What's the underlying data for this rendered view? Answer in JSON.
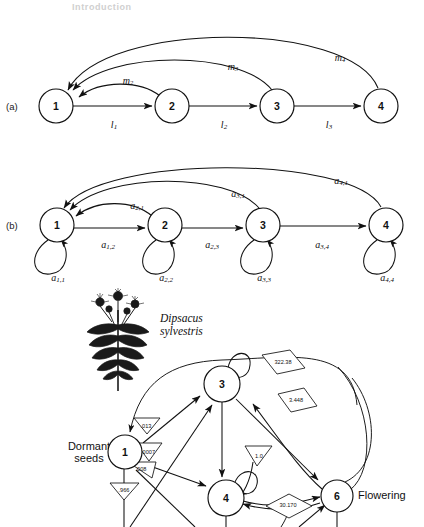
{
  "header": {
    "running_title": "Introduction"
  },
  "panel_a": {
    "tag": "(a)",
    "nodes": [
      {
        "id": "1",
        "cx": 56,
        "cy": 106
      },
      {
        "id": "2",
        "cx": 172,
        "cy": 106
      },
      {
        "id": "3",
        "cx": 277,
        "cy": 106
      },
      {
        "id": "4",
        "cx": 381,
        "cy": 106
      }
    ],
    "forward_labels": [
      {
        "base": "l",
        "sub": "1",
        "x": 114,
        "y": 124
      },
      {
        "base": "l",
        "sub": "2",
        "x": 224,
        "y": 124
      },
      {
        "base": "l",
        "sub": "3",
        "x": 329,
        "y": 124
      }
    ],
    "return_labels": [
      {
        "base": "m",
        "sub": "2",
        "x": 128,
        "y": 80
      },
      {
        "base": "m",
        "sub": "3",
        "x": 233,
        "y": 66
      },
      {
        "base": "m",
        "sub": "4",
        "x": 340,
        "y": 57
      }
    ]
  },
  "panel_b": {
    "tag": "(b)",
    "nodes": [
      {
        "id": "1",
        "cx": 57,
        "cy": 225
      },
      {
        "id": "2",
        "cx": 165,
        "cy": 225
      },
      {
        "id": "3",
        "cx": 263,
        "cy": 225
      },
      {
        "id": "4",
        "cx": 386,
        "cy": 225
      }
    ],
    "forward_labels": [
      {
        "base": "a",
        "sub": "1,2",
        "x": 108,
        "y": 244
      },
      {
        "base": "a",
        "sub": "2,3",
        "x": 212,
        "y": 244
      },
      {
        "base": "a",
        "sub": "3,4",
        "x": 322,
        "y": 244
      }
    ],
    "return_labels": [
      {
        "base": "a",
        "sub": "2,1",
        "x": 137,
        "y": 205
      },
      {
        "base": "a",
        "sub": "3,1",
        "x": 238,
        "y": 193
      },
      {
        "base": "a",
        "sub": "4,1",
        "x": 341,
        "y": 180
      }
    ],
    "self_labels": [
      {
        "base": "a",
        "sub": "1,1",
        "x": 58,
        "y": 277
      },
      {
        "base": "a",
        "sub": "2,2",
        "x": 166,
        "y": 277
      },
      {
        "base": "a",
        "sub": "3,3",
        "x": 264,
        "y": 277
      },
      {
        "base": "a",
        "sub": "4,4",
        "x": 387,
        "y": 277
      }
    ]
  },
  "life_cycle": {
    "species": "Dipsacus\nsylvestris",
    "species_line1": "Dipsacus",
    "species_line2": "sylvestris",
    "dormant_label_line1": "Dormant",
    "dormant_label_line2": "seeds",
    "flowering_label": "Flowering",
    "nodes": [
      {
        "id": "1",
        "cx": 125,
        "cy": 452,
        "r": 17
      },
      {
        "id": "3",
        "cx": 222,
        "cy": 384,
        "r": 18
      },
      {
        "id": "4",
        "cx": 226,
        "cy": 498,
        "r": 18
      },
      {
        "id": "6",
        "cx": 337,
        "cy": 496,
        "r": 16
      }
    ],
    "triangle_values": [
      {
        "value": ".013",
        "x": 146,
        "y": 426
      },
      {
        "value": ".0007",
        "x": 148,
        "y": 452
      },
      {
        "value": ".008",
        "x": 141,
        "y": 469
      },
      {
        "value": ".966",
        "x": 124,
        "y": 490
      },
      {
        "value": "1.0",
        "x": 259,
        "y": 456
      }
    ],
    "diamond_values": [
      {
        "value": "322.38",
        "x": 283,
        "y": 362
      },
      {
        "value": "3.448",
        "x": 296,
        "y": 400
      },
      {
        "value": "30.170",
        "x": 288,
        "y": 505
      }
    ]
  }
}
